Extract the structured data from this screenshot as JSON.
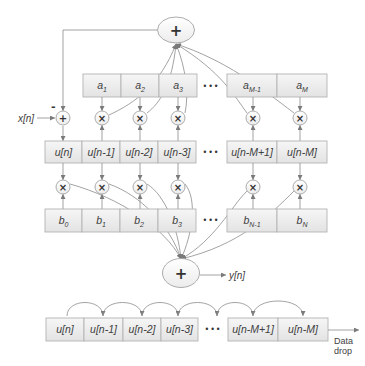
{
  "diagram": {
    "top_adder": {
      "symbol": "+"
    },
    "feedback_sign": "-",
    "input_label": "x[n]",
    "input_adder": {
      "symbol": "+"
    },
    "multiplier_symbol": "×",
    "ellipsis": "•••",
    "a_row": [
      {
        "base": "a",
        "sub": "1"
      },
      {
        "base": "a",
        "sub": "2"
      },
      {
        "base": "a",
        "sub": "3"
      },
      {
        "base": "a",
        "sub": "M-1"
      },
      {
        "base": "a",
        "sub": "M"
      }
    ],
    "u_row": [
      "u[n]",
      "u[n-1]",
      "u[n-2]",
      "u[n-3]",
      "u[n-M+1]",
      "u[n-M]"
    ],
    "b_row": [
      {
        "base": "b",
        "sub": "0"
      },
      {
        "base": "b",
        "sub": "1"
      },
      {
        "base": "b",
        "sub": "2"
      },
      {
        "base": "b",
        "sub": "3"
      },
      {
        "base": "b",
        "sub": "N-1"
      },
      {
        "base": "b",
        "sub": "N"
      }
    ],
    "bottom_adder": {
      "symbol": "+"
    },
    "output_label": "y[n]",
    "shift_register": {
      "cells": [
        "u[n]",
        "u[n-1]",
        "u[n-2]",
        "u[n-3]",
        "u[n-M+1]",
        "u[n-M]"
      ],
      "drop_label_line1": "Data",
      "drop_label_line2": "drop"
    }
  },
  "colors": {
    "line": "#8c8c8c",
    "box_fill_top": "#f5f5f5",
    "box_fill_bottom": "#e4e4e4",
    "box_border": "#b3b3b3",
    "text": "#404040",
    "node_border": "#a3a3a3"
  }
}
